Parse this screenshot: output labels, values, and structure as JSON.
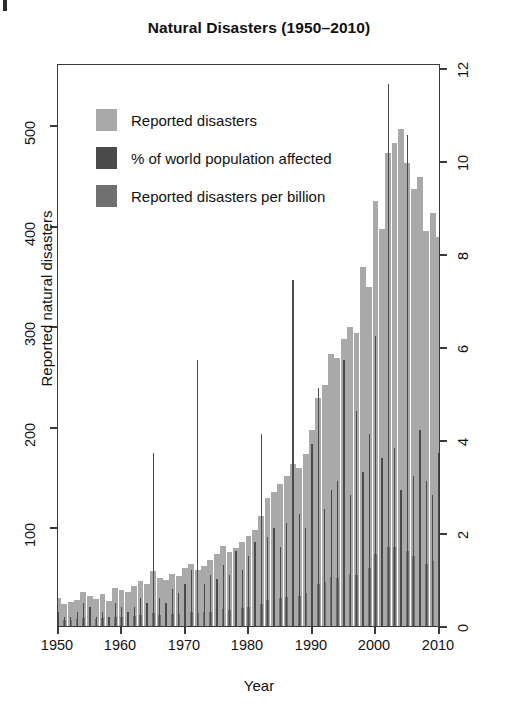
{
  "chart_data": {
    "type": "bar",
    "title": "Natural Disasters (1950–2010)",
    "xlabel": "Year",
    "ylabel": "Reported natural disasters",
    "ylabel_right": "% of world population affected",
    "xlim": [
      1950,
      2010
    ],
    "ylim": [
      0,
      560
    ],
    "ylim_right": [
      0,
      12
    ],
    "xticks": [
      1950,
      1960,
      1970,
      1980,
      1990,
      2000,
      2010
    ],
    "yticks": [
      100,
      200,
      300,
      400,
      500
    ],
    "yticks_right": [
      0,
      2,
      4,
      6,
      8,
      10,
      12
    ],
    "grid": false,
    "legend_position": "upper-left-inside",
    "colors": {
      "reported_disasters": "#a9a9a9",
      "pct_population_affected": "#4a4a4a",
      "disasters_per_billion": "#707070",
      "axis": "#3a3a3a",
      "text": "#111111",
      "background": "#ffffff"
    },
    "legend": [
      {
        "label": "Reported disasters",
        "color": "#a9a9a9",
        "series": "reported_disasters"
      },
      {
        "label": "% of world population affected",
        "color": "#4a4a4a",
        "series": "pct_population_affected"
      },
      {
        "label": "Reported disasters per billion",
        "color": "#707070",
        "series": "disasters_per_billion"
      }
    ],
    "x": [
      1950,
      1951,
      1952,
      1953,
      1954,
      1955,
      1956,
      1957,
      1958,
      1959,
      1960,
      1961,
      1962,
      1963,
      1964,
      1965,
      1966,
      1967,
      1968,
      1969,
      1970,
      1971,
      1972,
      1973,
      1974,
      1975,
      1976,
      1977,
      1978,
      1979,
      1980,
      1981,
      1982,
      1983,
      1984,
      1985,
      1986,
      1987,
      1988,
      1989,
      1990,
      1991,
      1992,
      1993,
      1994,
      1995,
      1996,
      1997,
      1998,
      1999,
      2000,
      2001,
      2002,
      2003,
      2004,
      2005,
      2006,
      2007,
      2008,
      2009,
      2010
    ],
    "series": [
      {
        "name": "Reported disasters",
        "axis": "left",
        "units": "count",
        "values": [
          28,
          22,
          24,
          26,
          34,
          30,
          27,
          32,
          25,
          38,
          36,
          34,
          40,
          45,
          42,
          55,
          48,
          46,
          52,
          50,
          58,
          62,
          56,
          60,
          66,
          72,
          80,
          74,
          78,
          84,
          90,
          96,
          110,
          128,
          134,
          142,
          150,
          162,
          158,
          172,
          196,
          228,
          241,
          272,
          268,
          286,
          298,
          292,
          358,
          338,
          424,
          396,
          472,
          482,
          496,
          462,
          436,
          448,
          394,
          412,
          388
        ]
      },
      {
        "name": "% of world population affected",
        "axis": "right",
        "units": "percent",
        "values": [
          0.3,
          0.2,
          0.2,
          0.3,
          0.5,
          0.4,
          0.2,
          0.3,
          0.2,
          0.5,
          0.4,
          0.3,
          0.4,
          0.6,
          0.5,
          3.7,
          0.6,
          0.5,
          0.8,
          0.7,
          0.9,
          1.2,
          5.7,
          0.9,
          1.1,
          1.0,
          1.3,
          1.1,
          1.6,
          1.2,
          1.5,
          1.8,
          4.1,
          1.9,
          2.1,
          1.7,
          2.2,
          7.4,
          2.4,
          2.1,
          3.9,
          5.1,
          2.5,
          2.9,
          3.1,
          5.7,
          2.8,
          4.6,
          3.3,
          4.1,
          6.2,
          3.6,
          11.6,
          3.8,
          2.9,
          10.5,
          3.2,
          4.2,
          3.1,
          2.8,
          3.7
        ]
      },
      {
        "name": "Reported disasters per billion",
        "axis": "right",
        "units": "per-billion-scaled",
        "values": [
          0.15,
          0.12,
          0.13,
          0.14,
          0.18,
          0.16,
          0.15,
          0.17,
          0.13,
          0.2,
          0.19,
          0.18,
          0.21,
          0.23,
          0.22,
          0.28,
          0.24,
          0.23,
          0.26,
          0.25,
          0.28,
          0.3,
          0.27,
          0.29,
          0.31,
          0.34,
          0.37,
          0.34,
          0.36,
          0.38,
          0.4,
          0.42,
          0.48,
          0.55,
          0.57,
          0.6,
          0.63,
          0.67,
          0.65,
          0.7,
          0.78,
          0.9,
          0.94,
          1.05,
          1.02,
          1.08,
          1.12,
          1.09,
          1.32,
          1.24,
          1.54,
          1.42,
          1.68,
          1.7,
          1.74,
          1.6,
          1.5,
          1.53,
          1.33,
          1.38,
          1.28
        ]
      }
    ]
  }
}
